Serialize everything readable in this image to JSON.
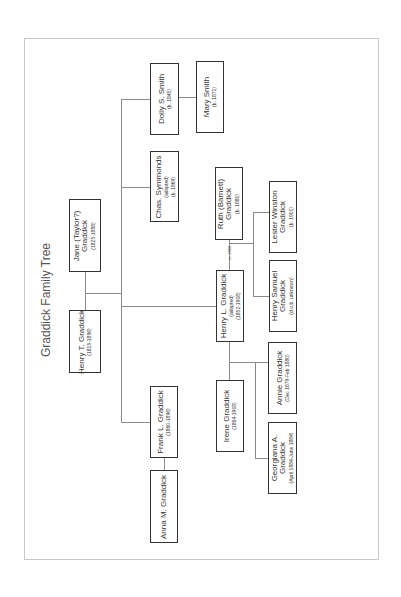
{
  "title": "Graddick Family Tree",
  "colors": {
    "box_border": "#333333",
    "connector": "#8a8a8a",
    "frame": "#c8c8c8",
    "text": "#333333"
  },
  "people": {
    "henry_t": {
      "name": "Henry T. Graddick",
      "lines": [
        "(1815-1896)"
      ]
    },
    "jane": {
      "name": "Jane (Taylor?) Graddick",
      "name_lines": [
        "Jane (Taylor?)",
        "Graddick"
      ],
      "lines": [
        "(1825-1888)"
      ]
    },
    "chas": {
      "name": "Chas. Symmonds",
      "lines": [
        "(adopted)",
        "(b. 1869)"
      ]
    },
    "dolly": {
      "name": "Dolly S. Smith",
      "lines": [
        "(b. 1845)"
      ]
    },
    "mary": {
      "name": "Mary Smith",
      "lines": [
        "(b. 1871)"
      ]
    },
    "henry_l": {
      "name": "Henry L. Graddick",
      "lines": [
        "(adopted)",
        "(1852-1908)"
      ]
    },
    "ruth": {
      "name": "Ruth (Barnett) Graddick",
      "name_lines": [
        "Ruth (Barnett)",
        "Graddick"
      ],
      "lines": [
        "(b. 1880)"
      ]
    },
    "lester": {
      "name": "Lester Winston Graddick",
      "name_lines": [
        "Lester Winston",
        "Graddick"
      ],
      "lines": [
        "(b. 1901)"
      ]
    },
    "henry_s": {
      "name": "Henry Samuel Graddick",
      "name_lines": [
        "Henry Samuel",
        "Graddick"
      ],
      "lines": [
        "(d.o.b. unknown)"
      ]
    },
    "irene": {
      "name": "Irene Graddick",
      "lines": [
        "(1864-1908)"
      ]
    },
    "annie": {
      "name": "Annie Graddick",
      "lines": [
        "(Dec 1879-Feb 1880)"
      ]
    },
    "georgiana": {
      "name": "Georgiana A. Graddick",
      "name_lines": [
        "Georgiana A.",
        "Graddick"
      ],
      "lines": [
        "(April 1884-June 1884)"
      ]
    },
    "frank": {
      "name": "Frank L. Graddick",
      "lines": [
        "(1860-1896)"
      ]
    },
    "anna": {
      "name": "Anna M. Graddick",
      "lines": []
    }
  },
  "marriage_label": "m. 1899"
}
